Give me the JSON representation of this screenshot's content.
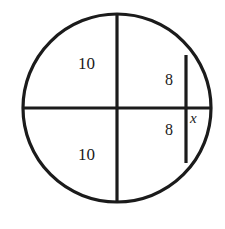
{
  "figure": {
    "background_color": "#ffffff",
    "stroke_color": "#1b1b1b",
    "labels": {
      "chord_upper_10": "10",
      "chord_lower_10": "10",
      "half_chord_upper_8": "8",
      "half_chord_lower_8": "8",
      "unknown_segment_x": "x"
    }
  },
  "chart_data": {
    "type": "diagram",
    "shapes": [
      {
        "name": "circle",
        "kind": "circle",
        "center": [
          117,
          108
        ],
        "radius": 94,
        "stroke": "#1b1b1b",
        "stroke_width": 3,
        "fill": "none"
      },
      {
        "name": "horizontal-diameter",
        "kind": "line",
        "from": [
          23,
          108
        ],
        "to": [
          211,
          108
        ],
        "stroke": "#1b1b1b",
        "stroke_width": 3
      },
      {
        "name": "vertical-diameter",
        "kind": "line",
        "from": [
          117,
          14
        ],
        "to": [
          117,
          202
        ],
        "stroke": "#1b1b1b",
        "stroke_width": 3
      },
      {
        "name": "vertical-chord-right",
        "kind": "line",
        "from": [
          186,
          55
        ],
        "to": [
          186,
          163
        ],
        "stroke": "#1b1b1b",
        "stroke_width": 3
      }
    ],
    "annotations": [
      {
        "name": "chord-upper-10",
        "text": "10",
        "at": [
          86,
          63
        ],
        "segment": "upper half of vertical diameter"
      },
      {
        "name": "chord-lower-10",
        "text": "10",
        "at": [
          86,
          154
        ],
        "segment": "lower half of vertical diameter"
      },
      {
        "name": "half-chord-upper-8",
        "text": "8",
        "at": [
          171,
          80
        ],
        "segment": "upper half of right vertical chord"
      },
      {
        "name": "half-chord-lower-8",
        "text": "8",
        "at": [
          171,
          130
        ],
        "segment": "lower half of right vertical chord"
      },
      {
        "name": "unknown-segment-x",
        "text": "x",
        "at": [
          196,
          118
        ],
        "segment": "horizontal distance from chord to circle"
      }
    ],
    "xlim": [
      0,
      225
    ],
    "ylim": [
      229,
      0
    ],
    "grid": false,
    "legend": false
  }
}
